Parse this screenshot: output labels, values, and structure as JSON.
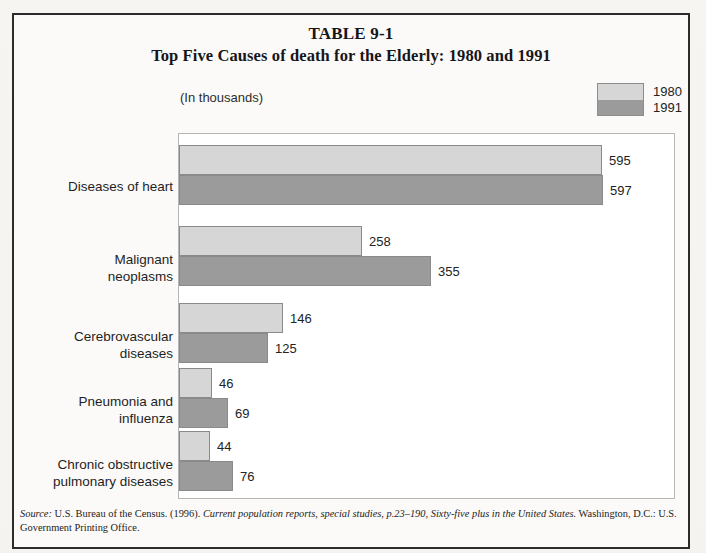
{
  "table": {
    "number": "TABLE 9-1",
    "title": "Top Five Causes of death for the Elderly: 1980 and 1991",
    "units_note": "(In thousands)"
  },
  "legend": {
    "entries": [
      {
        "label": "1980",
        "color": "#d6d6d6"
      },
      {
        "label": "1991",
        "color": "#9b9b9b"
      }
    ]
  },
  "source": {
    "label": "Source:",
    "text_before": " U.S. Bureau of the Census. (1996). ",
    "italic_title": "Current population reports, special studies, p.23–190, Sixty-five plus in the United States.",
    "text_after": " Washington, D.C.: U.S. Government Printing Office."
  },
  "chart_data": {
    "type": "bar",
    "orientation": "horizontal",
    "title": "Top Five Causes of death for the Elderly: 1980 and 1991",
    "subtitle": "TABLE 9-1",
    "xlabel": "",
    "ylabel": "",
    "unit": "thousands",
    "grid": false,
    "legend_position": "top-right",
    "xlim": [
      0,
      700
    ],
    "categories": [
      "Diseases of heart",
      "Malignant neoplasms",
      "Cerebrovascular diseases",
      "Pneumonia and influenza",
      "Chronic obstructive pulmonary diseases"
    ],
    "category_lines": [
      [
        "Diseases of heart"
      ],
      [
        "Malignant",
        "neoplasms"
      ],
      [
        "Cerebrovascular",
        "diseases"
      ],
      [
        "Pneumonia and",
        "influenza"
      ],
      [
        "Chronic obstructive",
        "pulmonary diseases"
      ]
    ],
    "series": [
      {
        "name": "1980",
        "color": "#d6d6d6",
        "values": [
          595,
          258,
          146,
          46,
          44
        ]
      },
      {
        "name": "1991",
        "color": "#9b9b9b",
        "values": [
          597,
          355,
          125,
          69,
          76
        ]
      }
    ]
  }
}
